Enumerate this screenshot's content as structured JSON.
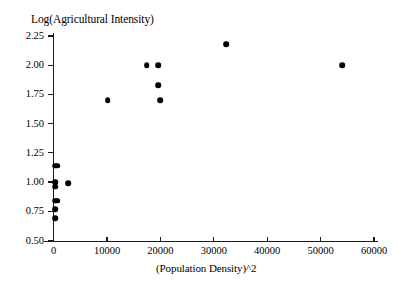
{
  "chart_data": {
    "type": "scatter",
    "title": "Log(Agricultural Intensity)",
    "xlabel": "(Population Density)^2",
    "ylabel": "Log(Agricultural Intensity)",
    "xlim": [
      -2000,
      62000
    ],
    "ylim": [
      0.5,
      2.3
    ],
    "grid": false,
    "legend_position": "none",
    "x_ticks": [
      0,
      10000,
      20000,
      30000,
      40000,
      50000,
      60000
    ],
    "x_tick_labels": [
      "0",
      "10000",
      "20000",
      "30000",
      "40000",
      "50000",
      "60000"
    ],
    "y_ticks": [
      0.5,
      0.75,
      1.0,
      1.25,
      1.5,
      1.75,
      2.0,
      2.25
    ],
    "y_tick_labels": [
      "0.50",
      "0.75",
      "1.00",
      "1.25",
      "1.50",
      "1.75",
      "2.00",
      "2.25"
    ],
    "marker": "filled-circle",
    "marker_color": "#000000",
    "points": [
      {
        "x": 250,
        "y": 1.14
      },
      {
        "x": 700,
        "y": 1.14
      },
      {
        "x": 250,
        "y": 1.0
      },
      {
        "x": 300,
        "y": 0.96
      },
      {
        "x": 2700,
        "y": 0.99
      },
      {
        "x": 250,
        "y": 0.84
      },
      {
        "x": 700,
        "y": 0.84
      },
      {
        "x": 250,
        "y": 0.77
      },
      {
        "x": 250,
        "y": 0.69
      },
      {
        "x": 10100,
        "y": 1.7
      },
      {
        "x": 17400,
        "y": 2.0
      },
      {
        "x": 19600,
        "y": 2.0
      },
      {
        "x": 19600,
        "y": 1.83
      },
      {
        "x": 20000,
        "y": 1.7
      },
      {
        "x": 32300,
        "y": 2.18
      },
      {
        "x": 54000,
        "y": 2.0
      }
    ]
  },
  "axes": {
    "y_tick_labels": [
      "2.25",
      "2.00",
      "1.75",
      "1.50",
      "1.25",
      "1.00",
      "0.75",
      "0.50"
    ],
    "x_tick_labels": [
      "0",
      "10000",
      "20000",
      "30000",
      "40000",
      "50000",
      "60000"
    ]
  }
}
